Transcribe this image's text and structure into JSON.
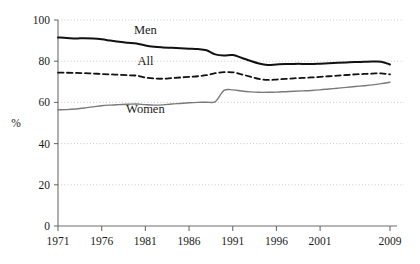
{
  "chart_data": {
    "type": "line",
    "title": "",
    "subtitle": "",
    "xlabel": "",
    "ylabel": "%",
    "xlim": [
      1971,
      2009
    ],
    "ylim": [
      0,
      100
    ],
    "grid": true,
    "grid_axis": "y",
    "legend": "inline-labels",
    "y_ticks": [
      0,
      20,
      40,
      60,
      80,
      100
    ],
    "y_tick_labels": [
      "0",
      "20",
      "40",
      "60",
      "80",
      "100"
    ],
    "x_ticks": [
      1971,
      1976,
      1981,
      1986,
      1991,
      1996,
      2001,
      2009
    ],
    "x_tick_labels": [
      "1971",
      "1976",
      "1981",
      "1986",
      "1991",
      "1996",
      "2001",
      "2009"
    ],
    "x": [
      1971,
      1972,
      1973,
      1974,
      1975,
      1976,
      1977,
      1978,
      1979,
      1980,
      1981,
      1982,
      1983,
      1984,
      1985,
      1986,
      1987,
      1988,
      1989,
      1990,
      1991,
      1992,
      1993,
      1994,
      1995,
      1996,
      1997,
      1998,
      1999,
      2000,
      2001,
      2002,
      2003,
      2004,
      2005,
      2006,
      2007,
      2008,
      2009
    ],
    "series": [
      {
        "name": "Men",
        "color": "#111111",
        "style": "solid",
        "width": 2.0,
        "label_x": 1981,
        "label_y": 93,
        "values": [
          91.5,
          91.3,
          91.0,
          91.2,
          91.0,
          90.6,
          90.0,
          89.4,
          89.0,
          88.6,
          87.6,
          87.0,
          86.7,
          86.5,
          86.3,
          86.1,
          85.9,
          85.3,
          83.3,
          82.8,
          83.0,
          81.7,
          80.2,
          78.9,
          78.2,
          78.4,
          78.6,
          78.7,
          78.7,
          78.6,
          78.8,
          79.0,
          79.2,
          79.4,
          79.6,
          79.7,
          79.8,
          79.7,
          78.4
        ]
      },
      {
        "name": "All",
        "color": "#111111",
        "style": "dashed",
        "width": 1.8,
        "label_x": 1981,
        "label_y": 78,
        "values": [
          74.5,
          74.4,
          74.3,
          74.2,
          74.0,
          73.8,
          73.6,
          73.4,
          73.2,
          73.0,
          72.1,
          71.6,
          71.5,
          71.8,
          72.1,
          72.4,
          72.7,
          73.2,
          74.2,
          74.7,
          74.6,
          73.6,
          72.5,
          71.4,
          70.9,
          71.1,
          71.4,
          71.7,
          71.9,
          72.1,
          72.4,
          72.7,
          73.0,
          73.3,
          73.6,
          73.8,
          74.0,
          74.1,
          73.6
        ]
      },
      {
        "name": "Women",
        "color": "#7a7a7a",
        "style": "solid",
        "width": 1.4,
        "label_x": 1981,
        "label_y": 55,
        "values": [
          56.4,
          56.5,
          56.8,
          57.3,
          57.8,
          58.4,
          58.7,
          58.9,
          59.1,
          59.2,
          58.9,
          58.7,
          58.8,
          59.2,
          59.5,
          59.8,
          60.0,
          60.1,
          60.4,
          65.8,
          66.1,
          65.5,
          65.1,
          64.9,
          64.9,
          65.0,
          65.2,
          65.4,
          65.6,
          65.8,
          66.1,
          66.5,
          66.9,
          67.3,
          67.7,
          68.1,
          68.5,
          69.1,
          69.8
        ]
      }
    ]
  },
  "axes": {
    "y_label": "%",
    "y_labels": [
      "100",
      "80",
      "60",
      "40",
      "20",
      "0"
    ],
    "x_labels": [
      "1971",
      "1976",
      "1981",
      "1986",
      "1991",
      "1996",
      "2001",
      "2009"
    ]
  },
  "labels": {
    "men": "Men",
    "all": "All",
    "women": "Women"
  },
  "colors": {
    "men_line": "#111111",
    "all_line": "#111111",
    "women_line": "#7a7a7a",
    "gridline": "#c9c9c9",
    "axis": "#6e6e6e",
    "text": "#1a1a1a",
    "background": "#ffffff"
  }
}
